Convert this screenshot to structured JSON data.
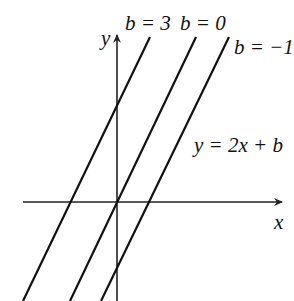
{
  "diagram": {
    "equation": "y = 2x + b",
    "axes": {
      "x_label": "x",
      "y_label": "y"
    },
    "lines": [
      {
        "b": 3,
        "label": "b = 3"
      },
      {
        "b": 0,
        "label": "b = 0"
      },
      {
        "b": -1,
        "label": "b = −1"
      }
    ],
    "colors": {
      "stroke": "#111111",
      "background": "#ffffff"
    }
  }
}
